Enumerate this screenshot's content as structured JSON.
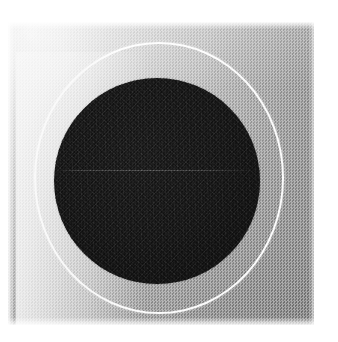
{
  "figure": {
    "kind": "scanned-halftone-photograph",
    "title": "",
    "caption": "",
    "medium": "halftone print scan",
    "background_color": "#ffffff"
  },
  "plate": {
    "name": "grey halftone field",
    "x": 8,
    "y": 22,
    "width": 306,
    "height": 303,
    "tone_light_corner": "#f3f3f3",
    "tone_mid": "#b4b4b4",
    "tone_dark_corner": "#979797",
    "screen_type": "halftone dot",
    "screen_pitch_px": 3
  },
  "dark_disk": {
    "name": "dark disk",
    "center_x": 157,
    "center_y": 181,
    "radius": 103,
    "color": "#101010",
    "edge_softness_px": 2
  },
  "white_ring": {
    "name": "white circular outline",
    "center_x": 159,
    "center_y": 178,
    "radius_x": 125,
    "radius_y": 136,
    "stroke_width": 2,
    "color": "#ffffff",
    "visibility_note": "bright on the darker right side, nearly lost against the pale upper-left background"
  },
  "scan_line": {
    "name": "faint horizontal scan line",
    "y": 170,
    "x_start": 56,
    "x_end": 258,
    "color": "#2a2a2a"
  },
  "labels": {
    "none_present": true
  }
}
